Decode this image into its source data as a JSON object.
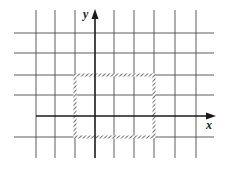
{
  "diagram": {
    "type": "coordinate-grid",
    "axes": {
      "x_label": "x",
      "y_label": "y"
    },
    "grid": {
      "vertical_lines_px": [
        36,
        55,
        75,
        114,
        134,
        154,
        175,
        196
      ],
      "horizontal_lines_px": [
        33,
        53,
        75,
        95,
        137
      ],
      "x_extent_px": [
        14,
        214
      ],
      "y_extent_px": [
        10,
        158
      ]
    },
    "x_axis_px": {
      "y": 116,
      "x_start": 36,
      "x_end": 214
    },
    "y_axis_px": {
      "x": 95,
      "y_start": 158,
      "y_end": 10
    },
    "rectangle": {
      "description": "hatched rectangle",
      "grid_coords": {
        "x_from": -1,
        "x_to": 3,
        "y_from": -1,
        "y_to": 2
      },
      "px": {
        "x": 75,
        "y": 75,
        "width": 79,
        "height": 62
      }
    },
    "colors": {
      "lines": "#3a3a3a",
      "axes": "#1a1a1a",
      "rectangle": "#333333"
    }
  }
}
